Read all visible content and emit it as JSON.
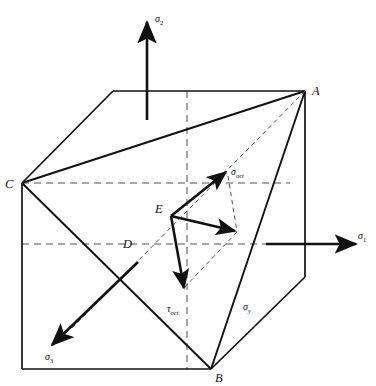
{
  "figure": {
    "background_color": "#ffffff",
    "line_color": "#111111",
    "dashed_color": "#555555"
  },
  "axes": [
    {
      "id": "sigma1",
      "symbol": "σ",
      "subscript": "1",
      "direction": "right",
      "label": "σ₁"
    },
    {
      "id": "sigma2",
      "symbol": "σ",
      "subscript": "2",
      "direction": "up",
      "label": "σ₂"
    },
    {
      "id": "sigma3",
      "symbol": "σ",
      "subscript": "3",
      "direction": "down-left",
      "label": "σ₃"
    }
  ],
  "vertices": [
    {
      "id": "A",
      "label": "A",
      "x": 305,
      "y": 91
    },
    {
      "id": "B",
      "label": "B",
      "x": 211,
      "y": 369
    },
    {
      "id": "C",
      "label": "C",
      "x": 22,
      "y": 183
    },
    {
      "id": "D",
      "label": "D",
      "x": 130,
      "y": 244
    },
    {
      "id": "E",
      "label": "E",
      "x": 171,
      "y": 212
    }
  ],
  "vectors": [
    {
      "id": "sigma_oct",
      "label": "σ",
      "subscript": "oct",
      "from": "E",
      "direction": "up-right",
      "description": "octahedral normal stress"
    },
    {
      "id": "tau_oct",
      "label": "τ",
      "subscript": "oct",
      "from": "E",
      "direction": "down",
      "description": "octahedral shear stress"
    },
    {
      "id": "resultant",
      "label": "",
      "subscript": "",
      "from": "E",
      "direction": "right-down",
      "description": "resultant stress vector (unlabeled)"
    }
  ],
  "plane_labels": [
    {
      "id": "sigma_y",
      "symbol": "σ",
      "subscript": "y",
      "label": "σᵧ",
      "x": 247,
      "y": 312
    }
  ],
  "octahedral_plane": {
    "description": "triangle ABC inscribed in the cube",
    "corners": [
      "A",
      "B",
      "C"
    ]
  }
}
